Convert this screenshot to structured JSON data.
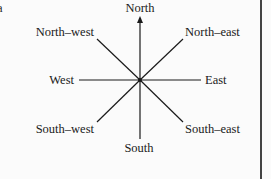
{
  "corner_mark": "a",
  "center_label": "",
  "directions": [
    {
      "key": "north",
      "label": "North"
    },
    {
      "key": "north_east",
      "label": "North–east"
    },
    {
      "key": "east",
      "label": "East"
    },
    {
      "key": "south_east",
      "label": "South–east"
    },
    {
      "key": "south",
      "label": "South"
    },
    {
      "key": "south_west",
      "label": "South–west"
    },
    {
      "key": "west",
      "label": "West"
    },
    {
      "key": "north_west",
      "label": "North–west"
    }
  ],
  "colors": {
    "ink": "#1a1a1a",
    "background": "#fbfbfb",
    "border": "#444444"
  }
}
